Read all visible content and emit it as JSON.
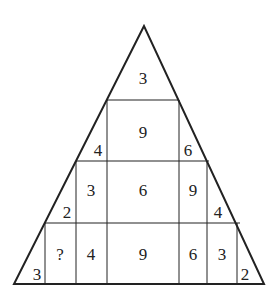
{
  "puzzle": {
    "title": "Number triangle puzzle",
    "cells": {
      "top": "3",
      "row2_center": "9",
      "row2_left": "4",
      "row2_right": "6",
      "row3_left_corner": "2",
      "row3_a": "3",
      "row3_center": "6",
      "row3_b": "9",
      "row3_right_corner": "4",
      "row4_left_corner": "3",
      "row4_unknown": "?",
      "row4_a": "4",
      "row4_center": "9",
      "row4_b": "6",
      "row4_c": "3",
      "row4_right_corner": "2"
    },
    "line_color": "#222222"
  }
}
